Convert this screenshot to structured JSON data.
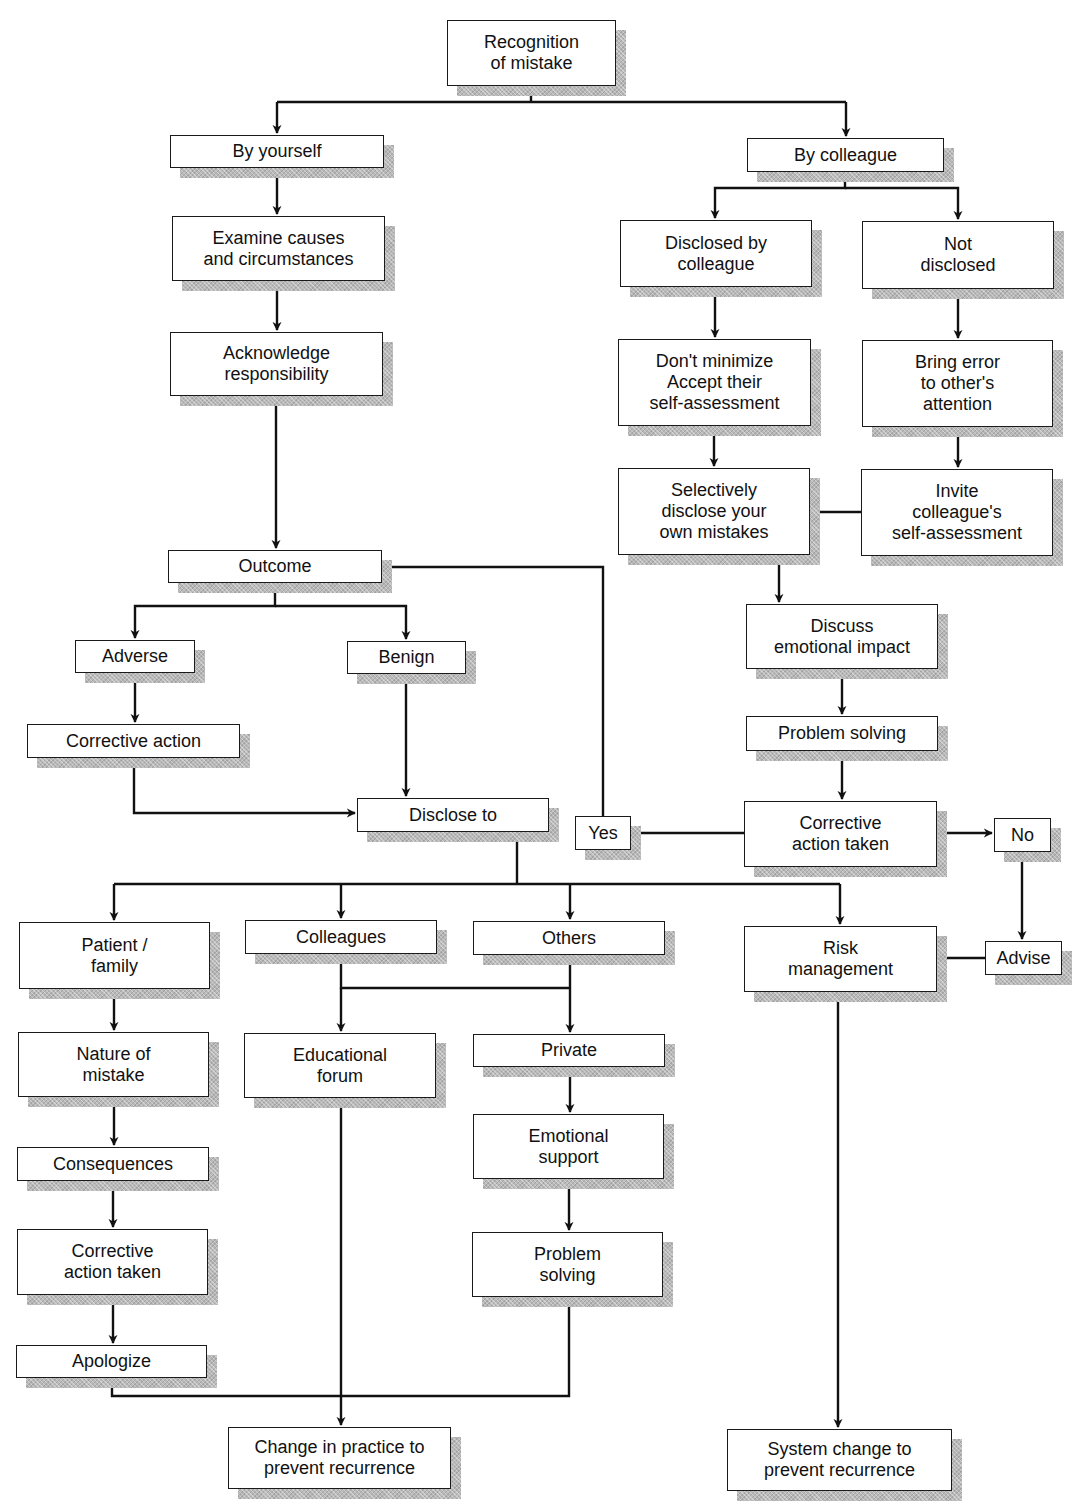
{
  "diagram": {
    "type": "flowchart",
    "title": "Recognition of mistake",
    "nodes": {
      "recognition": "Recognition\nof mistake",
      "by_yourself": "By yourself",
      "examine": "Examine causes\nand circumstances",
      "acknowledge": "Acknowledge\nresponsibility",
      "outcome": "Outcome",
      "adverse": "Adverse",
      "benign": "Benign",
      "corrective_action": "Corrective action",
      "disclose_to": "Disclose to",
      "by_colleague": "By colleague",
      "disclosed_by_colleague": "Disclosed by\ncolleague",
      "not_disclosed": "Not\ndisclosed",
      "dont_minimize": "Don't minimize\nAccept their\nself-assessment",
      "bring_error": "Bring error\nto other's\nattention",
      "selectively_disclose": "Selectively\ndisclose your\nown mistakes",
      "invite_self_assessment": "Invite\ncolleague's\nself-assessment",
      "discuss_emotional": "Discuss\nemotional impact",
      "problem_solving_right": "Problem solving",
      "corrective_action_taken_right": "Corrective\naction taken",
      "yes": "Yes",
      "no": "No",
      "advise": "Advise",
      "risk_management": "Risk\nmanagement",
      "patient_family": "Patient /\nfamily",
      "colleagues": "Colleagues",
      "others": "Others",
      "nature_of_mistake": "Nature of\nmistake",
      "educational_forum": "Educational\nforum",
      "private": "Private",
      "consequences": "Consequences",
      "emotional_support": "Emotional\nsupport",
      "corrective_action_taken_left": "Corrective\naction taken",
      "problem_solving_mid": "Problem\nsolving",
      "apologize": "Apologize",
      "change_in_practice": "Change in practice to\nprevent recurrence",
      "system_change": "System change to\nprevent recurrence"
    },
    "edges": [
      [
        "recognition",
        "by_yourself"
      ],
      [
        "recognition",
        "by_colleague"
      ],
      [
        "by_yourself",
        "examine"
      ],
      [
        "examine",
        "acknowledge"
      ],
      [
        "acknowledge",
        "outcome"
      ],
      [
        "outcome",
        "adverse"
      ],
      [
        "outcome",
        "benign"
      ],
      [
        "adverse",
        "corrective_action"
      ],
      [
        "corrective_action",
        "disclose_to"
      ],
      [
        "benign",
        "disclose_to"
      ],
      [
        "by_colleague",
        "disclosed_by_colleague"
      ],
      [
        "by_colleague",
        "not_disclosed"
      ],
      [
        "disclosed_by_colleague",
        "dont_minimize"
      ],
      [
        "not_disclosed",
        "bring_error"
      ],
      [
        "dont_minimize",
        "selectively_disclose"
      ],
      [
        "bring_error",
        "invite_self_assessment"
      ],
      [
        "invite_self_assessment",
        "selectively_disclose"
      ],
      [
        "selectively_disclose",
        "discuss_emotional"
      ],
      [
        "discuss_emotional",
        "problem_solving_right"
      ],
      [
        "problem_solving_right",
        "corrective_action_taken_right"
      ],
      [
        "corrective_action_taken_right",
        "yes"
      ],
      [
        "corrective_action_taken_right",
        "no"
      ],
      [
        "yes",
        "outcome"
      ],
      [
        "no",
        "advise"
      ],
      [
        "advise",
        "risk_management"
      ],
      [
        "disclose_to",
        "patient_family"
      ],
      [
        "disclose_to",
        "colleagues"
      ],
      [
        "disclose_to",
        "others"
      ],
      [
        "disclose_to",
        "risk_management"
      ],
      [
        "patient_family",
        "nature_of_mistake"
      ],
      [
        "nature_of_mistake",
        "consequences"
      ],
      [
        "consequences",
        "corrective_action_taken_left"
      ],
      [
        "corrective_action_taken_left",
        "apologize"
      ],
      [
        "colleagues",
        "educational_forum"
      ],
      [
        "colleagues",
        "private"
      ],
      [
        "others",
        "private"
      ],
      [
        "others",
        "educational_forum"
      ],
      [
        "private",
        "emotional_support"
      ],
      [
        "emotional_support",
        "problem_solving_mid"
      ],
      [
        "educational_forum",
        "change_in_practice"
      ],
      [
        "apologize",
        "change_in_practice"
      ],
      [
        "problem_solving_mid",
        "change_in_practice"
      ],
      [
        "risk_management",
        "system_change"
      ]
    ]
  }
}
